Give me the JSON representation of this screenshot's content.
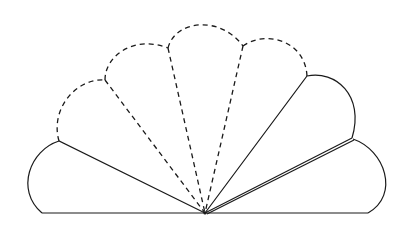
{
  "diagram": {
    "pivot": {
      "x": 205,
      "y": 213
    },
    "blades": [
      {
        "id": "blade-1",
        "style": "solid"
      },
      {
        "id": "blade-2",
        "style": "dashed"
      },
      {
        "id": "blade-3",
        "style": "dashed"
      },
      {
        "id": "blade-4",
        "style": "dashed"
      },
      {
        "id": "blade-5",
        "style": "dashed"
      },
      {
        "id": "blade-6",
        "style": "solid"
      },
      {
        "id": "blade-7",
        "style": "solid"
      }
    ],
    "line_color": "#1a1a1a",
    "background": "#ffffff"
  }
}
